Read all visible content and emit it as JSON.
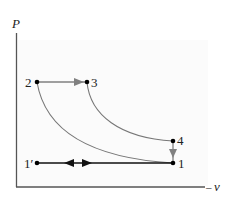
{
  "diagram": {
    "type": "P-v diagram",
    "axes": {
      "y_label": "P",
      "x_label": "v",
      "x_label_prefix": "–"
    },
    "points": {
      "p1": "1",
      "p1prime": "1′",
      "p2": "2",
      "p3": "3",
      "p4": "4"
    },
    "processes": [
      {
        "from": "2",
        "to": "3",
        "kind": "constant pressure"
      },
      {
        "from": "3",
        "to": "4",
        "kind": "curve"
      },
      {
        "from": "4",
        "to": "1",
        "kind": "constant volume"
      },
      {
        "from": "1",
        "to": "2",
        "kind": "curve"
      },
      {
        "from": "1′",
        "to": "1",
        "kind": "constant pressure, bidirectional"
      }
    ],
    "colors": {
      "axis": "#555555",
      "curve": "#777777",
      "arrow_gray": "#808080",
      "line_dark": "#111111",
      "panel": "#fafafa"
    }
  }
}
